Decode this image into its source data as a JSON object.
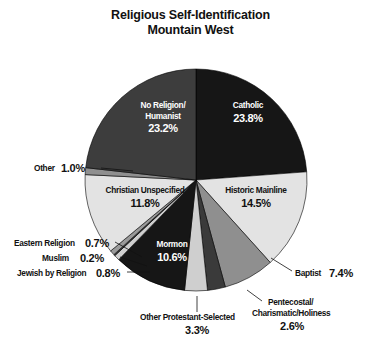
{
  "title": {
    "line1": "Religious Self-Identification",
    "line2": "Mountain West"
  },
  "chart_data": {
    "type": "pie",
    "title": "Religious Self-Identification Mountain West",
    "start_angle_deg": 0,
    "direction": "clockwise",
    "units": "percent",
    "legend": "none (labels on/around slices)",
    "categories": [
      "Catholic",
      "Historic Mainline",
      "Baptist",
      "Pentecostal/Charismatic/Holiness",
      "Other Protestant-Selected",
      "Mormon",
      "Jewish by Religion",
      "Muslim",
      "Eastern Religion",
      "Christian Unspecified",
      "Other",
      "No Religion/Humanist"
    ],
    "values": [
      23.8,
      14.5,
      7.4,
      2.6,
      3.3,
      10.6,
      0.8,
      0.2,
      0.7,
      11.8,
      1.0,
      23.2
    ],
    "slices": [
      {
        "name": "Catholic",
        "value": 23.8,
        "label": "Catholic",
        "pct_label": "23.8%",
        "color": "#161616",
        "label_color": "#ffffff",
        "placement": "inside"
      },
      {
        "name": "Historic Mainline",
        "value": 14.5,
        "label": "Historic Mainline",
        "pct_label": "14.5%",
        "color": "#e3e3e3",
        "label_color": "#111111",
        "placement": "inside"
      },
      {
        "name": "Baptist",
        "value": 7.4,
        "label": "Baptist",
        "pct_label": "7.4%",
        "color": "#8f8f8f",
        "label_color": "#111111",
        "placement": "outside"
      },
      {
        "name": "Pentecostal/Charismatic/Holiness",
        "value": 2.6,
        "label_line1": "Pentecostal/",
        "label_line2": "Charismatic/Holiness",
        "pct_label": "2.6%",
        "color": "#3a3a3a",
        "label_color": "#111111",
        "placement": "outside"
      },
      {
        "name": "Other Protestant-Selected",
        "value": 3.3,
        "label": "Other Protestant-Selected",
        "pct_label": "3.3%",
        "color": "#cfcfcf",
        "label_color": "#111111",
        "placement": "outside"
      },
      {
        "name": "Mormon",
        "value": 10.6,
        "label": "Mormon",
        "pct_label": "10.6%",
        "color": "#161616",
        "label_color": "#ffffff",
        "placement": "inside"
      },
      {
        "name": "Jewish by Religion",
        "value": 0.8,
        "label": "Jewish by Religion",
        "pct_label": "0.8%",
        "color": "#cfcfcf",
        "label_color": "#111111",
        "placement": "outside"
      },
      {
        "name": "Muslim",
        "value": 0.2,
        "label": "Muslim",
        "pct_label": "0.2%",
        "color": "#3a3a3a",
        "label_color": "#111111",
        "placement": "outside"
      },
      {
        "name": "Eastern Religion",
        "value": 0.7,
        "label": "Eastern Religion",
        "pct_label": "0.7%",
        "color": "#9a9a9a",
        "label_color": "#111111",
        "placement": "outside"
      },
      {
        "name": "Christian Unspecified",
        "value": 11.8,
        "label": "Christian Unspecified",
        "pct_label": "11.8%",
        "color": "#e3e3e3",
        "label_color": "#111111",
        "placement": "inside"
      },
      {
        "name": "Other",
        "value": 1.0,
        "label": "Other",
        "pct_label": "1.0%",
        "color": "#8f8f8f",
        "label_color": "#111111",
        "placement": "outside"
      },
      {
        "name": "No Religion/Humanist",
        "value": 23.2,
        "label_line1": "No Religion/",
        "label_line2": "Humanist",
        "pct_label": "23.2%",
        "color": "#3d3d3d",
        "label_color": "#ffffff",
        "placement": "inside"
      }
    ],
    "background": "#ffffff",
    "outline_color": "#000000"
  }
}
